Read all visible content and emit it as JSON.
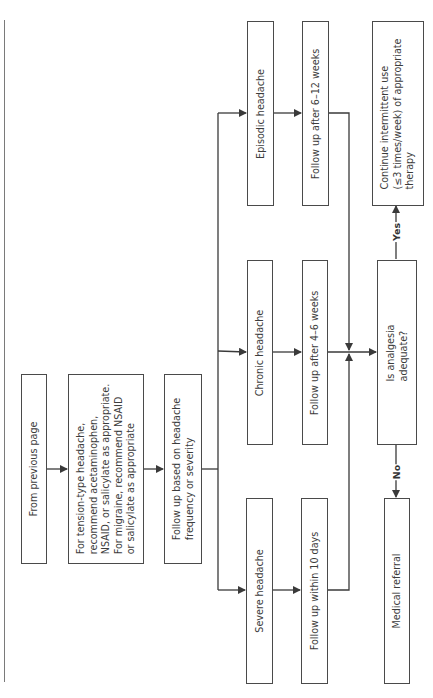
{
  "diagram": {
    "orientation": "rotated-90-ccw",
    "nodes": {
      "start": "From previous page",
      "treatment": "For tension-type headache,\nrecommend acetaminophen,\nNSAID, or salicylate as appropriate.\nFor migraine, recommend NSAID\nor salicylate as appropriate",
      "follow_up_basis": "Follow up based on headache\nfrequency or severity",
      "severe": "Severe headache",
      "chronic": "Chronic headache",
      "episodic": "Episodic headache",
      "follow_severe": "Follow up within 10 days",
      "follow_chronic": "Follow up after 4–6 weeks",
      "follow_episodic": "Follow up after 6–12 weeks",
      "decision": "Is analgesia\nadequate?",
      "yes_outcome": "Continue intermittent use\n(≤3 times/week) of appropriate\ntherapy",
      "no_outcome": "Medical referral"
    },
    "edge_labels": {
      "yes": "Yes",
      "no": "No"
    },
    "colors": {
      "line": "#3a3a3a",
      "box_border": "#4a4a4a",
      "background": "#ffffff"
    }
  }
}
